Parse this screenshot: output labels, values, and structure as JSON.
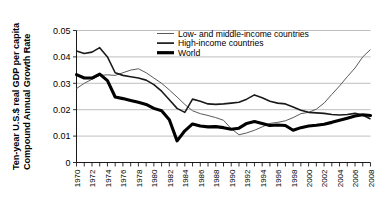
{
  "chart_data": {
    "type": "line",
    "title": "",
    "xlabel": "",
    "ylabel": "Ten-year U.S.$ real GDP per capita Compound Annual Growth Rate",
    "ylabel_line1": "Ten-year U.S.$ real GDP per capita",
    "ylabel_line2": "Compound Annual Growth Rate",
    "ylim": [
      0,
      0.05
    ],
    "xlim": [
      1970,
      2008
    ],
    "grid": true,
    "legend_position": "top-center",
    "ytick_labels": [
      "0.05",
      "0.04",
      "0.03",
      "0.02",
      "0.01",
      "0"
    ],
    "ytick_values": [
      0.05,
      0.04,
      0.03,
      0.02,
      0.01,
      0
    ],
    "xtick_labels": [
      "1970",
      "1972",
      "1974",
      "1976",
      "1978",
      "1980",
      "1982",
      "1984",
      "1986",
      "1988",
      "1990",
      "1992",
      "1994",
      "1996",
      "1998",
      "2000",
      "2002",
      "2004",
      "2006",
      "2008"
    ],
    "x": [
      1970,
      1971,
      1972,
      1973,
      1974,
      1975,
      1976,
      1977,
      1978,
      1979,
      1980,
      1981,
      1982,
      1983,
      1984,
      1985,
      1986,
      1987,
      1988,
      1989,
      1990,
      1991,
      1992,
      1993,
      1994,
      1995,
      1996,
      1997,
      1998,
      1999,
      2000,
      2001,
      2002,
      2003,
      2004,
      2005,
      2006,
      2007,
      2008
    ],
    "series": [
      {
        "name": "Low- and middle-income countries",
        "style": "thin",
        "values": [
          0.028,
          0.03,
          0.0315,
          0.033,
          0.0332,
          0.033,
          0.034,
          0.035,
          0.0355,
          0.034,
          0.032,
          0.03,
          0.0275,
          0.0248,
          0.022,
          0.0196,
          0.0185,
          0.0178,
          0.017,
          0.016,
          0.0128,
          0.0105,
          0.0112,
          0.0122,
          0.0135,
          0.0148,
          0.0152,
          0.0158,
          0.017,
          0.0185,
          0.019,
          0.0202,
          0.0225,
          0.0258,
          0.029,
          0.0325,
          0.0358,
          0.04,
          0.0428
        ]
      },
      {
        "name": "High-income countries",
        "style": "medium",
        "values": [
          0.0422,
          0.0413,
          0.0418,
          0.0435,
          0.04,
          0.034,
          0.033,
          0.0325,
          0.032,
          0.0312,
          0.0295,
          0.027,
          0.0238,
          0.0205,
          0.019,
          0.024,
          0.0232,
          0.0222,
          0.022,
          0.0222,
          0.0225,
          0.0228,
          0.024,
          0.0256,
          0.0245,
          0.0232,
          0.0225,
          0.0222,
          0.021,
          0.0198,
          0.019,
          0.0188,
          0.0186,
          0.0182,
          0.018,
          0.0182,
          0.0186,
          0.018,
          0.0165
        ]
      },
      {
        "name": "World",
        "style": "thick",
        "values": [
          0.0333,
          0.032,
          0.032,
          0.0335,
          0.031,
          0.0248,
          0.0242,
          0.0235,
          0.0228,
          0.022,
          0.0205,
          0.0196,
          0.0162,
          0.0082,
          0.012,
          0.0146,
          0.0138,
          0.0135,
          0.0136,
          0.0132,
          0.0126,
          0.013,
          0.0148,
          0.0155,
          0.0148,
          0.014,
          0.0142,
          0.014,
          0.0122,
          0.0132,
          0.0138,
          0.0141,
          0.0145,
          0.0152,
          0.016,
          0.0168,
          0.0176,
          0.0181,
          0.0178
        ]
      }
    ]
  },
  "legend": {
    "entries": [
      {
        "label": "Low- and middle-income countries",
        "style": "thin"
      },
      {
        "label": "High-income countries",
        "style": "medium"
      },
      {
        "label": "World",
        "style": "thick"
      }
    ]
  }
}
